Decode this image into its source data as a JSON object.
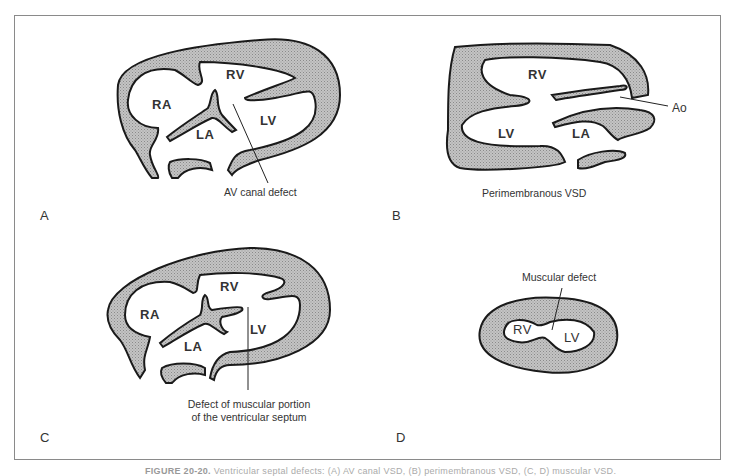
{
  "figure": {
    "caption_number": "FIGURE 20-20.",
    "caption_text": "Ventricular septal defects: (A) AV canal VSD, (B) perimembranous VSD, (C, D) muscular VSD."
  },
  "panels": [
    {
      "letter": "A",
      "annotation": "AV canal defect",
      "chambers": [
        "RV",
        "RA",
        "LA",
        "LV"
      ]
    },
    {
      "letter": "B",
      "annotation": "Perimembranous VSD",
      "chambers": [
        "RV",
        "LV",
        "LA"
      ],
      "pointer_label": "Ao"
    },
    {
      "letter": "C",
      "annotation_line1": "Defect of muscular portion",
      "annotation_line2": "of the ventricular septum",
      "chambers": [
        "RV",
        "RA",
        "LA",
        "LV"
      ]
    },
    {
      "letter": "D",
      "annotation": "Muscular defect",
      "chambers": [
        "RV",
        "LV"
      ]
    }
  ],
  "colors": {
    "myocardium_fill": "#b8b8b8",
    "outline": "#1a1a1a",
    "frame": "#8a8a8a"
  }
}
